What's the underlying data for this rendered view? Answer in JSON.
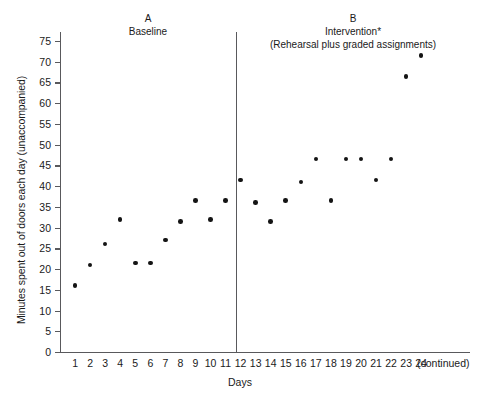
{
  "chart_data": {
    "type": "scatter",
    "title": "",
    "xlabel": "Days",
    "ylabel": "Minutes spent out of doors each day (unaccompanied)",
    "xlim": [
      0,
      25
    ],
    "ylim": [
      0,
      78
    ],
    "ytick_labels": [
      "0",
      "5",
      "10",
      "15",
      "20",
      "25",
      "30",
      "35",
      "40",
      "45",
      "50",
      "55",
      "60",
      "65",
      "70",
      "75"
    ],
    "ytick_values": [
      0,
      5,
      10,
      15,
      20,
      25,
      30,
      35,
      40,
      45,
      50,
      55,
      60,
      65,
      70,
      75
    ],
    "xtick_labels": [
      "1",
      "2",
      "3",
      "4",
      "5",
      "6",
      "7",
      "8",
      "9",
      "10",
      "11",
      "12",
      "13",
      "14",
      "15",
      "16",
      "17",
      "18",
      "19",
      "20",
      "21",
      "22",
      "23",
      "24"
    ],
    "xtick_values": [
      1,
      2,
      3,
      4,
      5,
      6,
      7,
      8,
      9,
      10,
      11,
      12,
      13,
      14,
      15,
      16,
      17,
      18,
      19,
      20,
      21,
      22,
      23,
      24
    ],
    "x_axis_end_note": "(continued)",
    "grid": false,
    "legend": null,
    "marker_color": "#141414",
    "axis_color": "#59595c",
    "phase_divider_x": 12.5,
    "x": [
      1,
      2,
      3,
      4,
      5,
      6,
      7,
      8,
      9,
      10,
      11,
      12,
      13,
      14,
      15,
      16,
      17,
      18,
      19,
      20,
      21,
      22,
      23,
      24
    ],
    "values": [
      16,
      21,
      26,
      32,
      21.5,
      21.5,
      27,
      31.5,
      36.5,
      32,
      36.5,
      41.5,
      36,
      31.5,
      36.5,
      41,
      46.5,
      36.5,
      46.5,
      46.5,
      41.5,
      46.5,
      66.5,
      71.5
    ],
    "series": [
      {
        "name": "Minutes out of doors (unaccompanied)",
        "x": [
          1,
          2,
          3,
          4,
          5,
          6,
          7,
          8,
          9,
          10,
          11,
          12,
          13,
          14,
          15,
          16,
          17,
          18,
          19,
          20,
          21,
          22,
          23,
          24
        ],
        "values": [
          16,
          21,
          26,
          32,
          21.5,
          21.5,
          27,
          31.5,
          36.5,
          32,
          36.5,
          41.5,
          36,
          31.5,
          36.5,
          41,
          46.5,
          36.5,
          46.5,
          46.5,
          41.5,
          46.5,
          66.5,
          71.5
        ]
      }
    ],
    "phases": [
      {
        "letter": "A",
        "label": "Baseline",
        "sublabel": "",
        "x_range": [
          1,
          12
        ]
      },
      {
        "letter": "B",
        "label": "Intervention*",
        "sublabel": "(Rehearsal plus graded assignments)",
        "x_range": [
          13,
          24
        ]
      }
    ]
  }
}
